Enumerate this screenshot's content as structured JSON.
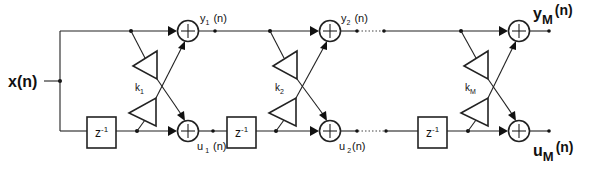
{
  "figure": {
    "input_label": "x(n)",
    "delay_label": "z",
    "delay_exp": "-1",
    "stages": [
      {
        "k": "k",
        "k_sub": "1",
        "y": "y",
        "y_sub": "1",
        "y_arg": "(n)",
        "u": "u",
        "u_sub": "1",
        "u_arg": "(n)"
      },
      {
        "k": "k",
        "k_sub": "2",
        "y": "y",
        "y_sub": "2",
        "y_arg": "(n)",
        "u": "u",
        "u_sub": "2",
        "u_arg": "(n)"
      },
      {
        "k": "k",
        "k_sub": "M",
        "y": "y",
        "y_sub": "M",
        "y_arg": "(n)",
        "u": "u",
        "u_sub": "M",
        "u_arg": "(n)"
      }
    ],
    "adder_symbol": "+"
  }
}
